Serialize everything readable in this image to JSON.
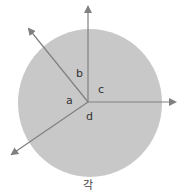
{
  "diagram": {
    "circle": {
      "cx": 90,
      "cy": 103,
      "rx": 72,
      "ry": 74,
      "fill": "#c8c8c8"
    },
    "vertex": {
      "x": 88,
      "y": 102
    },
    "rays": [
      {
        "name": "up",
        "x2": 88,
        "y2": 5
      },
      {
        "name": "right",
        "x2": 177,
        "y2": 102
      },
      {
        "name": "upper-left",
        "x2": 27,
        "y2": 27
      },
      {
        "name": "lower-left",
        "x2": 10,
        "y2": 155
      }
    ],
    "line_color": "#808080",
    "labels": {
      "a": "a",
      "b": "b",
      "c": "c",
      "d": "d"
    },
    "caption": "각"
  }
}
